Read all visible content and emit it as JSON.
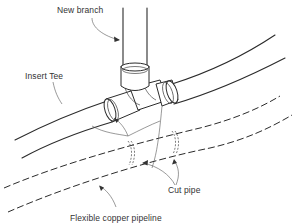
{
  "diagram": {
    "labels": {
      "new_branch": "New branch",
      "insert_tee": "Insert Tee",
      "cut_pipe": "Cut pipe",
      "flexible_copper_pipeline": "Flexible copper pipeline"
    },
    "colors": {
      "line": "#2b2b2b",
      "text": "#333333",
      "background": "#ffffff"
    }
  }
}
